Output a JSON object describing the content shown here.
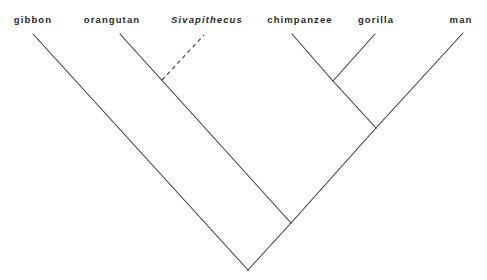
{
  "diagram": {
    "type": "cladogram",
    "stroke_color": "#3a3a3a",
    "taxa": [
      {
        "id": "gibbon",
        "label": "gibbon",
        "italic": false,
        "tip": [
          33,
          34
        ],
        "label_x": 33
      },
      {
        "id": "orangutan",
        "label": "orangutan",
        "italic": false,
        "tip": [
          120,
          34
        ],
        "label_x": 112
      },
      {
        "id": "sivapithecus",
        "label": "Sivapithecus",
        "italic": true,
        "tip": [
          204,
          35
        ],
        "label_x": 207,
        "fossil": true
      },
      {
        "id": "chimpanzee",
        "label": "chimpanzee",
        "italic": false,
        "tip": [
          292,
          34
        ],
        "label_x": 300
      },
      {
        "id": "gorilla",
        "label": "gorilla",
        "italic": false,
        "tip": [
          375,
          34
        ],
        "label_x": 376
      },
      {
        "id": "man",
        "label": "man",
        "italic": false,
        "tip": [
          463,
          33
        ],
        "label_x": 461
      }
    ],
    "label_y": 23,
    "nodes": {
      "root": [
        248,
        270
      ],
      "great_apes": [
        291,
        223
      ],
      "african_apes": [
        376,
        128
      ],
      "chimp_gorilla": [
        333,
        81
      ],
      "sivapithecus_attach": [
        162,
        80
      ]
    },
    "branches": [
      {
        "from": "root",
        "to": "gibbon",
        "style": "solid"
      },
      {
        "from": "root",
        "to": "great_apes",
        "style": "solid"
      },
      {
        "from": "great_apes",
        "to": "orangutan",
        "style": "solid"
      },
      {
        "from": "great_apes",
        "to": "african_apes",
        "style": "solid"
      },
      {
        "from": "african_apes",
        "to": "chimp_gorilla",
        "style": "solid"
      },
      {
        "from": "african_apes",
        "to": "man",
        "style": "solid"
      },
      {
        "from": "chimp_gorilla",
        "to": "chimpanzee",
        "style": "solid"
      },
      {
        "from": "chimp_gorilla",
        "to": "gorilla",
        "style": "solid"
      },
      {
        "from": "sivapithecus_attach",
        "to": "sivapithecus",
        "style": "dashed"
      }
    ]
  }
}
